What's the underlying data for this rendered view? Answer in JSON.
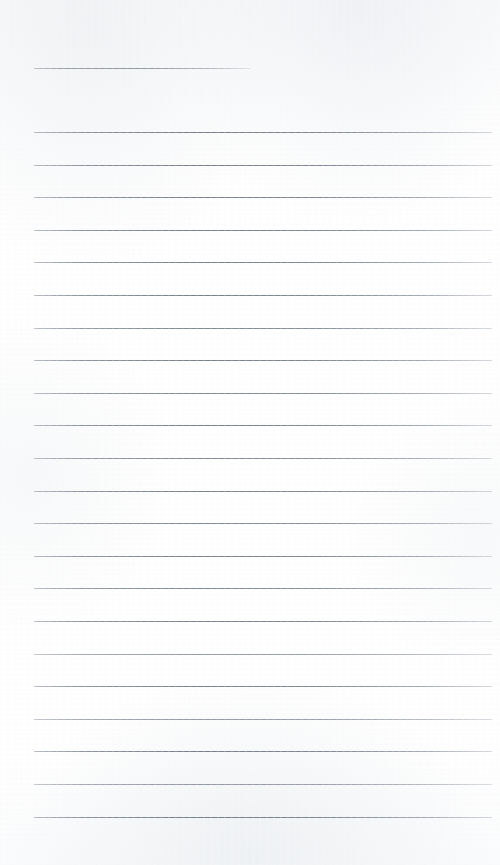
{
  "document": {
    "type": "lined-notebook-page",
    "title": "",
    "page_text": "",
    "paper_color": "#fdfdfd",
    "rule_color": "#767d8c",
    "page_width": 500,
    "page_height": 865,
    "line_count": 25,
    "line_spacing": 32.6,
    "margin_left": 34,
    "margin_right": 492
  },
  "rules": [
    {
      "name": "header-rule",
      "y": 68,
      "x1": 34,
      "x2": 250,
      "short": true
    },
    {
      "name": "body-rule-1",
      "y": 132,
      "x1": 34,
      "x2": 492,
      "short": false
    },
    {
      "name": "body-rule-2",
      "y": 164.6,
      "x1": 34,
      "x2": 492,
      "short": false
    },
    {
      "name": "body-rule-3",
      "y": 197.2,
      "x1": 34,
      "x2": 492,
      "short": false
    },
    {
      "name": "body-rule-4",
      "y": 229.8,
      "x1": 34,
      "x2": 492,
      "short": false
    },
    {
      "name": "body-rule-5",
      "y": 262.4,
      "x1": 34,
      "x2": 492,
      "short": false
    },
    {
      "name": "body-rule-6",
      "y": 295.0,
      "x1": 34,
      "x2": 492,
      "short": false
    },
    {
      "name": "body-rule-7",
      "y": 327.6,
      "x1": 34,
      "x2": 492,
      "short": false
    },
    {
      "name": "body-rule-8",
      "y": 360.2,
      "x1": 34,
      "x2": 492,
      "short": false
    },
    {
      "name": "body-rule-9",
      "y": 392.8,
      "x1": 34,
      "x2": 492,
      "short": false
    },
    {
      "name": "body-rule-10",
      "y": 425.4,
      "x1": 34,
      "x2": 492,
      "short": false
    },
    {
      "name": "body-rule-11",
      "y": 458.0,
      "x1": 34,
      "x2": 492,
      "short": false
    },
    {
      "name": "body-rule-12",
      "y": 490.6,
      "x1": 34,
      "x2": 492,
      "short": false
    },
    {
      "name": "body-rule-13",
      "y": 523.2,
      "x1": 34,
      "x2": 492,
      "short": false
    },
    {
      "name": "body-rule-14",
      "y": 555.8,
      "x1": 34,
      "x2": 492,
      "short": false
    },
    {
      "name": "body-rule-15",
      "y": 588.4,
      "x1": 34,
      "x2": 492,
      "short": false
    },
    {
      "name": "body-rule-16",
      "y": 621.0,
      "x1": 34,
      "x2": 492,
      "short": false
    },
    {
      "name": "body-rule-17",
      "y": 653.6,
      "x1": 34,
      "x2": 492,
      "short": false
    },
    {
      "name": "body-rule-18",
      "y": 686.2,
      "x1": 34,
      "x2": 492,
      "short": false
    },
    {
      "name": "body-rule-19",
      "y": 718.8,
      "x1": 34,
      "x2": 492,
      "short": false
    },
    {
      "name": "body-rule-20",
      "y": 751.4,
      "x1": 34,
      "x2": 492,
      "short": false
    },
    {
      "name": "body-rule-21",
      "y": 784.0,
      "x1": 34,
      "x2": 492,
      "short": false
    },
    {
      "name": "body-rule-22",
      "y": 816.6,
      "x1": 34,
      "x2": 492,
      "short": false
    }
  ]
}
